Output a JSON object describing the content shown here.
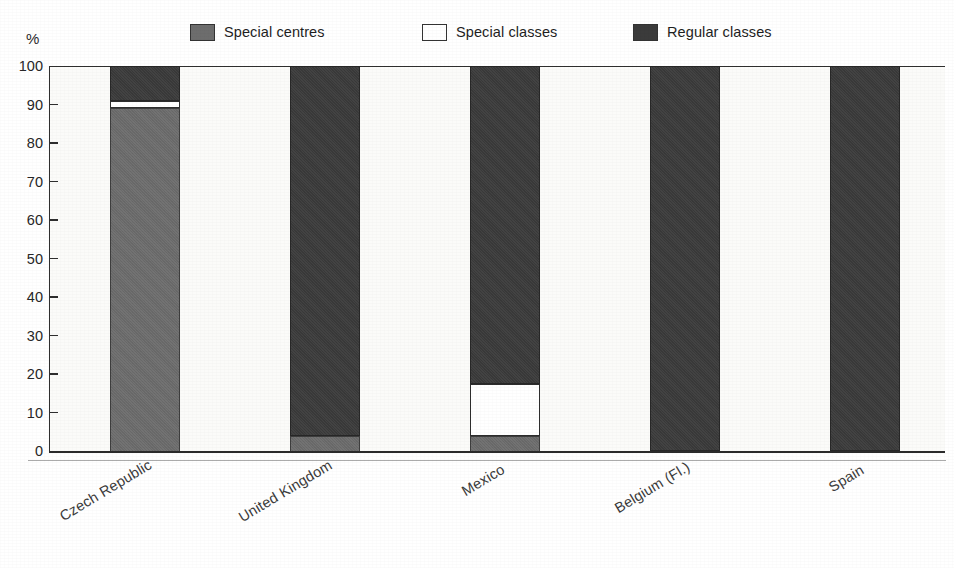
{
  "unit_label": "%",
  "legend": {
    "items": [
      {
        "label": "Special centres",
        "swatch": "filled-gray-swatch",
        "color": "#6d6d6d"
      },
      {
        "label": "Special classes",
        "swatch": "empty-white-swatch",
        "color": "#ffffff"
      },
      {
        "label": "Regular classes",
        "swatch": "filled-dark-swatch",
        "color": "#3b3b3b"
      }
    ]
  },
  "chart_data": {
    "type": "bar",
    "stacked": true,
    "stack_total": 100,
    "title": "",
    "subtitle": "",
    "xlabel": "",
    "ylabel": "%",
    "ylim": [
      0,
      100
    ],
    "yticks": [
      0,
      10,
      20,
      30,
      40,
      50,
      60,
      70,
      80,
      90,
      100
    ],
    "ytick_labels": [
      "0",
      "10",
      "20",
      "30",
      "40",
      "50",
      "60",
      "70",
      "80",
      "90",
      "100"
    ],
    "grid": false,
    "legend_position": "top",
    "categories": [
      "Czech Republic",
      "United Kingdom",
      "Mexico",
      "Belgium (Fl.)",
      "Spain"
    ],
    "series": [
      {
        "name": "Special centres",
        "color": "#6d6d6d",
        "values": [
          89,
          4,
          4,
          0,
          0
        ]
      },
      {
        "name": "Special classes",
        "color": "#ffffff",
        "values": [
          2,
          0,
          13.5,
          0,
          0
        ]
      },
      {
        "name": "Regular classes",
        "color": "#3b3b3b",
        "values": [
          9,
          96,
          82.5,
          100,
          100
        ]
      }
    ]
  }
}
